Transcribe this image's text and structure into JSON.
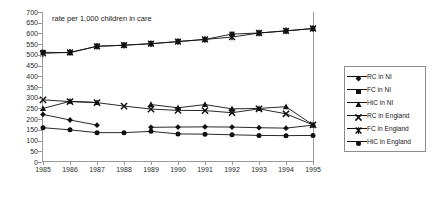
{
  "chart_data": {
    "type": "line",
    "title": "rate per 1,000 children in care",
    "xlabel": "",
    "ylabel": "",
    "ylim": [
      0,
      700
    ],
    "ytick_step": 50,
    "yticks": [
      0,
      50,
      100,
      150,
      200,
      250,
      300,
      350,
      400,
      450,
      500,
      550,
      600,
      650,
      700
    ],
    "grid": false,
    "legend_position": "right",
    "x": [
      1985,
      1986,
      1987,
      1988,
      1989,
      1990,
      1991,
      1992,
      1993,
      1994,
      1995
    ],
    "categories": [
      "1985",
      "1986",
      "1987",
      "1988",
      "1989",
      "1990",
      "1991",
      "1992",
      "1993",
      "1994",
      "1995"
    ],
    "series": [
      {
        "name": "RC in NI",
        "marker": "diamond",
        "values": [
          222,
          196,
          172,
          null,
          162,
          163,
          164,
          163,
          160,
          158,
          172
        ]
      },
      {
        "name": "FC in NI",
        "marker": "square",
        "values": [
          512,
          510,
          540,
          545,
          552,
          562,
          572,
          597,
          602,
          612,
          623
        ]
      },
      {
        "name": "HiC in NI",
        "marker": "triangle",
        "values": [
          250,
          283,
          278,
          null,
          268,
          253,
          268,
          248,
          250,
          258,
          173
        ]
      },
      {
        "name": "RC in England",
        "marker": "x",
        "values": [
          290,
          282,
          277,
          261,
          247,
          241,
          240,
          230,
          248,
          225,
          173
        ]
      },
      {
        "name": "FC in England",
        "marker": "asterisk",
        "values": [
          507,
          512,
          540,
          545,
          552,
          562,
          572,
          583,
          602,
          612,
          623
        ]
      },
      {
        "name": "HiC in England",
        "marker": "circle",
        "values": [
          160,
          150,
          137,
          137,
          143,
          131,
          130,
          127,
          124,
          123,
          124
        ]
      }
    ]
  },
  "legend": {
    "items": [
      {
        "label": "RC in NI"
      },
      {
        "label": "FC in NI"
      },
      {
        "label": "HiC in NI"
      },
      {
        "label": "RC in England"
      },
      {
        "label": "FC in England"
      },
      {
        "label": "HiC in England"
      }
    ]
  },
  "colors": {
    "line": "#111111",
    "axis": "#9a9a9a",
    "text": "#1a1a1a"
  }
}
